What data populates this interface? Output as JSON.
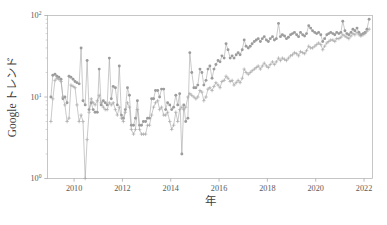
{
  "figure": {
    "background_color": "#ffffff",
    "series_color": "#9c9c9c",
    "frame_color": "#b9b9b9",
    "text_color": "#4a4a4a"
  },
  "chart_data": {
    "type": "line",
    "title": "",
    "xlabel": "年",
    "ylabel": "Google トレンド",
    "yscale": "log",
    "xscale": "linear",
    "xlim": [
      2008.9,
      2022.35
    ],
    "ylim": [
      1,
      100
    ],
    "grid": false,
    "legend": "none",
    "xticks": [
      2010,
      2012,
      2014,
      2016,
      2018,
      2020,
      2022
    ],
    "xtick_labels": [
      "2010",
      "2012",
      "2014",
      "2016",
      "2018",
      "2020",
      "2022"
    ],
    "yticks": [
      1,
      10,
      100
    ],
    "ytick_labels": [
      "10⁰",
      "10¹",
      "10²"
    ],
    "ytick_mantissa": [
      "10",
      "10",
      "10"
    ],
    "ytick_exponent": [
      "0",
      "1",
      "2"
    ],
    "series": [
      {
        "name": "series-dot",
        "marker": "circle",
        "x": [
          2009.04,
          2009.12,
          2009.21,
          2009.29,
          2009.37,
          2009.46,
          2009.54,
          2009.62,
          2009.71,
          2009.79,
          2009.87,
          2009.96,
          2010.04,
          2010.12,
          2010.21,
          2010.29,
          2010.37,
          2010.46,
          2010.54,
          2010.62,
          2010.71,
          2010.79,
          2010.87,
          2010.96,
          2011.04,
          2011.12,
          2011.21,
          2011.29,
          2011.37,
          2011.46,
          2011.54,
          2011.62,
          2011.71,
          2011.79,
          2011.87,
          2011.96,
          2012.04,
          2012.12,
          2012.21,
          2012.29,
          2012.37,
          2012.46,
          2012.54,
          2012.62,
          2012.71,
          2012.79,
          2012.87,
          2012.96,
          2013.04,
          2013.12,
          2013.21,
          2013.29,
          2013.37,
          2013.46,
          2013.54,
          2013.62,
          2013.71,
          2013.79,
          2013.87,
          2013.96,
          2014.04,
          2014.12,
          2014.21,
          2014.29,
          2014.37,
          2014.46,
          2014.54,
          2014.62,
          2014.71,
          2014.79,
          2014.87,
          2014.96,
          2015.04,
          2015.12,
          2015.21,
          2015.29,
          2015.37,
          2015.46,
          2015.54,
          2015.62,
          2015.71,
          2015.79,
          2015.87,
          2015.96,
          2016.04,
          2016.12,
          2016.21,
          2016.29,
          2016.37,
          2016.46,
          2016.54,
          2016.62,
          2016.71,
          2016.79,
          2016.87,
          2016.96,
          2017.04,
          2017.12,
          2017.21,
          2017.29,
          2017.37,
          2017.46,
          2017.54,
          2017.62,
          2017.71,
          2017.79,
          2017.87,
          2017.96,
          2018.04,
          2018.12,
          2018.21,
          2018.29,
          2018.37,
          2018.46,
          2018.54,
          2018.62,
          2018.71,
          2018.79,
          2018.87,
          2018.96,
          2019.04,
          2019.12,
          2019.21,
          2019.29,
          2019.37,
          2019.46,
          2019.54,
          2019.62,
          2019.71,
          2019.79,
          2019.87,
          2019.96,
          2020.04,
          2020.12,
          2020.21,
          2020.29,
          2020.37,
          2020.46,
          2020.54,
          2020.62,
          2020.71,
          2020.79,
          2020.87,
          2020.96,
          2021.04,
          2021.12,
          2021.21,
          2021.29,
          2021.37,
          2021.46,
          2021.54,
          2021.62,
          2021.71,
          2021.79,
          2021.87,
          2021.96,
          2022.04,
          2022.12,
          2022.21
        ],
        "y": [
          10.0,
          18.5,
          19.0,
          18.0,
          17.5,
          16.5,
          9.5,
          10.0,
          8.5,
          18.0,
          17.5,
          16.5,
          15.5,
          15.0,
          14.5,
          40.0,
          9.0,
          8.0,
          28.0,
          7.0,
          8.5,
          7.0,
          6.5,
          6.5,
          22.0,
          8.0,
          9.0,
          8.5,
          8.0,
          30.0,
          9.5,
          13.5,
          13.0,
          8.0,
          24.0,
          6.0,
          5.5,
          7.0,
          13.0,
          10.5,
          4.5,
          4.5,
          5.5,
          9.0,
          4.5,
          4.5,
          5.0,
          5.0,
          5.5,
          5.5,
          9.5,
          9.5,
          12.0,
          12.0,
          10.0,
          12.5,
          12.5,
          7.0,
          8.5,
          8.0,
          7.0,
          7.5,
          10.5,
          8.0,
          11.0,
          2.0,
          8.0,
          5.0,
          5.5,
          35.0,
          20.0,
          13.0,
          13.0,
          14.0,
          22.0,
          20.0,
          14.0,
          16.0,
          22.0,
          24.0,
          17.0,
          22.0,
          25.0,
          28.0,
          27.0,
          32.0,
          30.0,
          45.0,
          38.0,
          30.0,
          32.0,
          30.0,
          33.0,
          35.0,
          33.0,
          38.0,
          50.0,
          42.0,
          40.0,
          42.0,
          45.0,
          48.0,
          50.0,
          52.0,
          48.0,
          52.0,
          55.0,
          50.0,
          48.0,
          52.0,
          55.0,
          50.0,
          52.0,
          80.0,
          55.0,
          58.0,
          56.0,
          52.0,
          54.0,
          58.0,
          60.0,
          62.0,
          58.0,
          55.0,
          62.0,
          58.0,
          56.0,
          60.0,
          75.0,
          70.0,
          65.0,
          62.0,
          60.0,
          62.0,
          58.0,
          48.0,
          52.0,
          58.0,
          60.0,
          62.0,
          60.0,
          58.0,
          62.0,
          60.0,
          62.0,
          85.0,
          65.0,
          60.0,
          58.0,
          62.0,
          68.0,
          65.0,
          70.0,
          62.0,
          58.0,
          60.0,
          62.0,
          68.0,
          90.0
        ]
      },
      {
        "name": "series-plus",
        "marker": "plus",
        "x": [
          2009.04,
          2009.12,
          2009.21,
          2009.29,
          2009.37,
          2009.46,
          2009.54,
          2009.62,
          2009.71,
          2009.79,
          2009.87,
          2009.96,
          2010.04,
          2010.12,
          2010.21,
          2010.29,
          2010.37,
          2010.46,
          2010.54,
          2010.62,
          2010.71,
          2010.79,
          2010.87,
          2010.96,
          2011.04,
          2011.12,
          2011.21,
          2011.29,
          2011.37,
          2011.46,
          2011.54,
          2011.62,
          2011.71,
          2011.79,
          2011.87,
          2011.96,
          2012.04,
          2012.12,
          2012.21,
          2012.29,
          2012.37,
          2012.46,
          2012.54,
          2012.62,
          2012.71,
          2012.79,
          2012.87,
          2012.96,
          2013.04,
          2013.12,
          2013.21,
          2013.29,
          2013.37,
          2013.46,
          2013.54,
          2013.62,
          2013.71,
          2013.79,
          2013.87,
          2013.96,
          2014.04,
          2014.12,
          2014.21,
          2014.29,
          2014.37,
          2014.46,
          2014.54,
          2014.62,
          2014.71,
          2014.79,
          2014.87,
          2014.96,
          2015.04,
          2015.12,
          2015.21,
          2015.29,
          2015.37,
          2015.46,
          2015.54,
          2015.62,
          2015.71,
          2015.79,
          2015.87,
          2015.96,
          2016.04,
          2016.12,
          2016.21,
          2016.29,
          2016.37,
          2016.46,
          2016.54,
          2016.62,
          2016.71,
          2016.79,
          2016.87,
          2016.96,
          2017.04,
          2017.12,
          2017.21,
          2017.29,
          2017.37,
          2017.46,
          2017.54,
          2017.62,
          2017.71,
          2017.79,
          2017.87,
          2017.96,
          2018.04,
          2018.12,
          2018.21,
          2018.29,
          2018.37,
          2018.46,
          2018.54,
          2018.62,
          2018.71,
          2018.79,
          2018.87,
          2018.96,
          2019.04,
          2019.12,
          2019.21,
          2019.29,
          2019.37,
          2019.46,
          2019.54,
          2019.62,
          2019.71,
          2019.79,
          2019.87,
          2019.96,
          2020.04,
          2020.12,
          2020.21,
          2020.29,
          2020.37,
          2020.46,
          2020.54,
          2020.62,
          2020.71,
          2020.79,
          2020.87,
          2020.96,
          2021.04,
          2021.12,
          2021.21,
          2021.29,
          2021.37,
          2021.46,
          2021.54,
          2021.62,
          2021.71,
          2021.79,
          2021.87,
          2021.96,
          2022.04,
          2022.12,
          2022.21
        ],
        "y": [
          5.0,
          9.5,
          16.0,
          17.0,
          16.5,
          15.5,
          10.0,
          8.0,
          5.0,
          5.5,
          14.0,
          13.5,
          13.0,
          8.0,
          5.0,
          6.0,
          5.0,
          1.0,
          3.0,
          6.5,
          9.5,
          8.5,
          8.0,
          9.0,
          10.5,
          8.5,
          7.5,
          7.0,
          7.0,
          8.5,
          8.0,
          8.5,
          7.0,
          6.0,
          7.5,
          5.5,
          5.0,
          6.5,
          8.5,
          7.5,
          4.0,
          3.5,
          4.0,
          7.0,
          4.0,
          3.5,
          3.5,
          3.5,
          4.5,
          4.5,
          6.0,
          7.5,
          8.5,
          9.0,
          7.0,
          7.5,
          6.0,
          6.0,
          6.5,
          5.0,
          4.0,
          4.5,
          6.5,
          5.0,
          7.0,
          7.5,
          7.0,
          7.5,
          10.0,
          11.0,
          10.5,
          10.0,
          9.5,
          10.0,
          12.0,
          11.5,
          9.0,
          10.0,
          12.5,
          13.0,
          12.0,
          13.5,
          15.0,
          14.0,
          13.0,
          15.5,
          16.0,
          18.0,
          17.0,
          15.5,
          16.0,
          14.0,
          15.0,
          16.0,
          15.0,
          17.0,
          22.0,
          20.0,
          19.0,
          20.0,
          21.0,
          22.0,
          23.0,
          24.0,
          22.0,
          24.0,
          26.0,
          24.0,
          23.0,
          25.0,
          27.0,
          25.0,
          27.0,
          30.0,
          28.0,
          30.0,
          29.0,
          28.0,
          30.0,
          32.0,
          33.0,
          35.0,
          34.0,
          32.0,
          36.0,
          35.0,
          34.0,
          37.0,
          42.0,
          40.0,
          40.0,
          42.0,
          44.0,
          46.0,
          44.0,
          38.0,
          42.0,
          46.0,
          48.0,
          50.0,
          50.0,
          48.0,
          52.0,
          52.0,
          54.0,
          58.0,
          56.0,
          54.0,
          52.0,
          56.0,
          60.0,
          58.0,
          62.0,
          58.0,
          56.0,
          58.0,
          60.0,
          64.0,
          68.0
        ]
      }
    ]
  }
}
